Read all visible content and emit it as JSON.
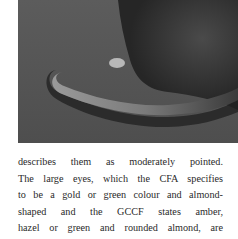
{
  "photo": {
    "subject": "cat tail curled on floor",
    "tone": "black-and-white"
  },
  "body_text": {
    "lines": [
      "describes them as moderately pointed.",
      "The large eyes, which the CFA specifies",
      "to be a gold or green colour and almond-",
      "shaped and the GCCF states amber,",
      "hazel or green and rounded almond, are"
    ]
  }
}
